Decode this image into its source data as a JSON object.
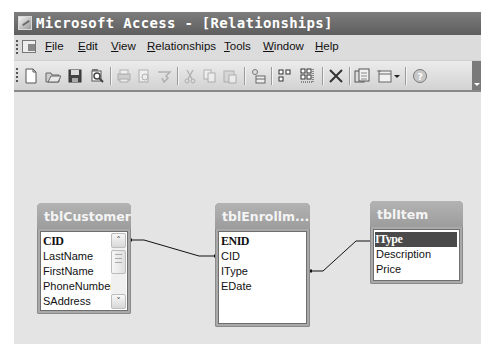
{
  "window": {
    "title": "Microsoft Access - [Relationships]",
    "app_icon": "access-key-icon"
  },
  "menubar": {
    "items": [
      {
        "label": "File",
        "accel": "F"
      },
      {
        "label": "Edit",
        "accel": "E"
      },
      {
        "label": "View",
        "accel": "V"
      },
      {
        "label": "Relationships",
        "accel": "R"
      },
      {
        "label": "Tools",
        "accel": "T"
      },
      {
        "label": "Window",
        "accel": "W"
      },
      {
        "label": "Help",
        "accel": "H"
      }
    ]
  },
  "toolbar": {
    "buttons": [
      {
        "name": "new-icon",
        "enabled": true
      },
      {
        "name": "open-icon",
        "enabled": true
      },
      {
        "name": "save-icon",
        "enabled": true
      },
      {
        "name": "file-search-icon",
        "enabled": true
      },
      {
        "name": "print-icon",
        "enabled": false
      },
      {
        "name": "print-preview-icon",
        "enabled": false
      },
      {
        "name": "spelling-icon",
        "enabled": false
      },
      {
        "name": "cut-icon",
        "enabled": false
      },
      {
        "name": "copy-icon",
        "enabled": false
      },
      {
        "name": "paste-icon",
        "enabled": false
      },
      {
        "name": "show-table-icon",
        "enabled": true
      },
      {
        "name": "show-direct-relationships-icon",
        "enabled": true
      },
      {
        "name": "show-all-relationships-icon",
        "enabled": true
      },
      {
        "name": "delete-icon",
        "enabled": true
      },
      {
        "name": "database-window-icon",
        "enabled": true
      },
      {
        "name": "new-object-icon",
        "enabled": true
      },
      {
        "name": "help-icon",
        "enabled": true
      }
    ]
  },
  "canvas": {
    "tables": [
      {
        "name": "tblCustomer",
        "fields": [
          "CID",
          "LastName",
          "FirstName",
          "PhoneNumber",
          "SAddress"
        ],
        "primary_key": "CID",
        "has_scrollbar": true
      },
      {
        "name": "tblEnrollm...",
        "fields": [
          "ENID",
          "CID",
          "IType",
          "EDate"
        ],
        "primary_key": "ENID",
        "has_scrollbar": false
      },
      {
        "name": "tblItem",
        "fields": [
          "IType",
          "Description",
          "Price"
        ],
        "primary_key": "IType",
        "selected_field": "IType",
        "has_scrollbar": false
      }
    ],
    "relationships": [
      {
        "from": "tblCustomer.CID",
        "to": "tblEnrollment.CID"
      },
      {
        "from": "tblEnrollment.IType",
        "to": "tblItem.IType"
      }
    ]
  },
  "colors": {
    "titlebar": "#6a6a6a",
    "canvas": "#e4e4e4",
    "table_header": "#a9a9a9",
    "selection": "#4a4a4a"
  }
}
